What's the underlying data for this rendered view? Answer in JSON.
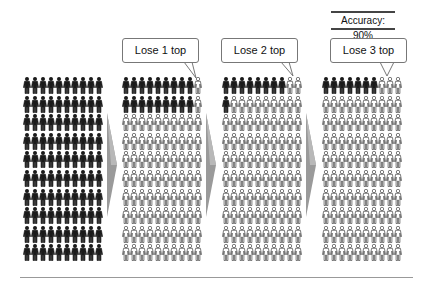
{
  "header": {
    "accuracy_label": "Accuracy: 90%"
  },
  "colors": {
    "dark_figure": "#1a1a1a",
    "light_figure_fill": "#ffffff",
    "light_figure_stroke": "#444444",
    "arrow_fill": "#9a9a9a",
    "callout_border": "#777777",
    "baseline": "#999999"
  },
  "grid": {
    "rows": 10,
    "cols": 10,
    "figure_icon": "person-icon"
  },
  "panels": [
    {
      "id": "initial",
      "callout": null,
      "dark_cells": 100,
      "dark_mask_desc": "all 100 dark"
    },
    {
      "id": "lose-1",
      "callout": "Lose 1 top",
      "dark_cells": 18,
      "dark_mask_desc": "rows 1-2 cols 1-9 dark"
    },
    {
      "id": "lose-2",
      "callout": "Lose 2 top",
      "dark_cells": 9,
      "dark_mask_desc": "row 1 cols 1-8 dark, row 2 col 1 dark"
    },
    {
      "id": "lose-3",
      "callout": "Lose 3 top",
      "dark_cells": 7,
      "dark_mask_desc": "row 1 cols 1-7 dark"
    }
  ],
  "arrows": [
    {
      "icon": "arrow-right-icon"
    },
    {
      "icon": "arrow-right-icon"
    },
    {
      "icon": "arrow-right-icon"
    }
  ]
}
